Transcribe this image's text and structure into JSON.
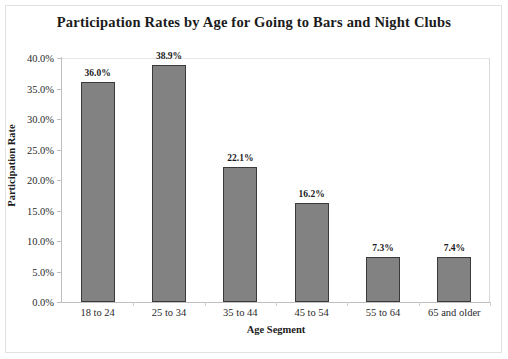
{
  "chart_data": {
    "type": "bar",
    "title": "Participation Rates by Age for Going to Bars and Night Clubs",
    "xlabel": "Age Segment",
    "ylabel": "Participation Rate",
    "categories": [
      "18 to 24",
      "25 to 34",
      "35 to 44",
      "45 to 54",
      "55 to 64",
      "65 and older"
    ],
    "values": [
      36.0,
      38.9,
      22.1,
      16.2,
      7.3,
      7.4
    ],
    "data_labels": [
      "36.0%",
      "38.9%",
      "22.1%",
      "16.2%",
      "7.3%",
      "7.4%"
    ],
    "ylim": [
      0,
      40
    ],
    "ytick_values": [
      0,
      5,
      10,
      15,
      20,
      25,
      30,
      35,
      40
    ],
    "ytick_labels": [
      "0.0%",
      "5.0%",
      "10.0%",
      "15.0%",
      "20.0%",
      "25.0%",
      "30.0%",
      "35.0%",
      "40.0%"
    ],
    "grid": false,
    "legend": null,
    "bar_color": "#828282",
    "bar_border_color": "#3a3a3a",
    "axis_color": "#bfbfbf",
    "text_color": "#1b1b1b"
  }
}
